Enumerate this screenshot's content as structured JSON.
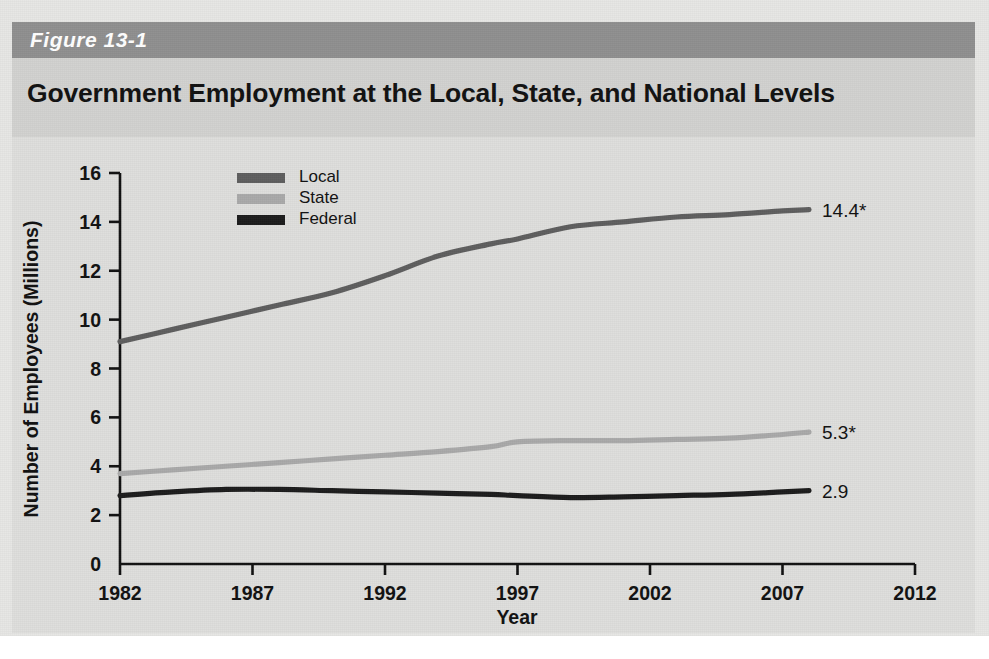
{
  "figure": {
    "number_label": "Figure 13-1",
    "title": "Government Employment at the Local, State, and National Levels"
  },
  "colors": {
    "header_band": "#8f8f8f",
    "title_band": "#d2d2d0",
    "plot_background": "#dededc",
    "local": "#5e5e5e",
    "state": "#a9a9a9",
    "federal": "#1c1c1c",
    "axis": "#111111"
  },
  "chart_data": {
    "type": "line",
    "title": "Government Employment at the Local, State, and National Levels",
    "xlabel": "Year",
    "ylabel": "Number of Employees (Millions)",
    "xlim": [
      1982,
      2012
    ],
    "ylim": [
      0,
      16
    ],
    "xticks": [
      "1982",
      "1987",
      "1992",
      "1997",
      "2002",
      "2007",
      "2012"
    ],
    "yticks": [
      "0",
      "2",
      "4",
      "6",
      "8",
      "10",
      "12",
      "14",
      "16"
    ],
    "grid": false,
    "legend_position": "top-center-inside",
    "x": [
      1982,
      1984,
      1986,
      1988,
      1990,
      1992,
      1994,
      1996,
      1997,
      1999,
      2001,
      2003,
      2005,
      2007,
      2008
    ],
    "series": [
      {
        "name": "Local",
        "color": "#5e5e5e",
        "values": [
          9.1,
          9.6,
          10.1,
          10.6,
          11.1,
          11.8,
          12.6,
          13.1,
          13.3,
          13.8,
          14.0,
          14.2,
          14.3,
          14.45,
          14.5
        ],
        "end_label": "14.4*"
      },
      {
        "name": "State",
        "color": "#a9a9a9",
        "values": [
          3.7,
          3.85,
          4.0,
          4.15,
          4.3,
          4.45,
          4.6,
          4.8,
          5.0,
          5.05,
          5.05,
          5.1,
          5.15,
          5.3,
          5.4
        ],
        "end_label": "5.3*"
      },
      {
        "name": "Federal",
        "color": "#1c1c1c",
        "values": [
          2.8,
          2.95,
          3.05,
          3.05,
          3.0,
          2.95,
          2.9,
          2.85,
          2.8,
          2.72,
          2.75,
          2.8,
          2.85,
          2.95,
          3.0
        ],
        "end_label": "2.9"
      }
    ],
    "annotations": [
      {
        "text": "14.4*",
        "series": "Local"
      },
      {
        "text": "5.3*",
        "series": "State"
      },
      {
        "text": "2.9",
        "series": "Federal"
      }
    ]
  }
}
